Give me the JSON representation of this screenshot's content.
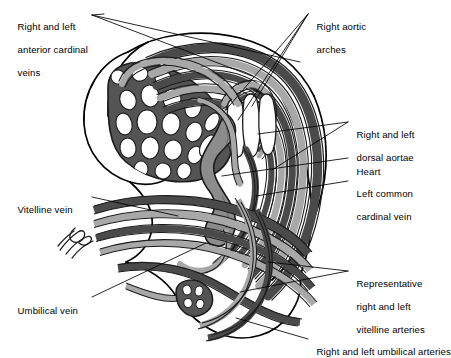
{
  "figure": {
    "background_color": "#ffffff",
    "width": 446,
    "height": 354
  },
  "palette": {
    "outline": "#000000",
    "vessel_dark": "#4a4a4a",
    "vessel_light": "#a8a8a8",
    "vessel_mid": "#6f6f6f",
    "heart_fill": "#8c8c8c",
    "plexus_fill": "#545454",
    "body_fill": "#ffffff",
    "leader_line": "#000000",
    "label_text": "#000000"
  },
  "labels": [
    {
      "id": "anterior-cardinal-veins",
      "lines": [
        "Right and left",
        "anterior cardinal",
        "veins"
      ],
      "text": "Right and left anterior cardinal veins",
      "align": "left",
      "x": 12,
      "y": 10
    },
    {
      "id": "right-aortic-arches",
      "lines": [
        "Right aortic",
        "arches"
      ],
      "text": "Right aortic arches",
      "align": "left",
      "x": 311,
      "y": 10
    },
    {
      "id": "dorsal-aortae",
      "lines": [
        "Right and left",
        "dorsal aortae"
      ],
      "text": "Right and left dorsal aortae",
      "align": "left",
      "x": 351,
      "y": 118
    },
    {
      "id": "heart",
      "lines": [
        "Heart"
      ],
      "text": "Heart",
      "align": "left",
      "x": 351,
      "y": 155
    },
    {
      "id": "left-common-cardinal-vein",
      "lines": [
        "Left common",
        "cardinal vein"
      ],
      "text": "Left common cardinal vein",
      "align": "left",
      "x": 351,
      "y": 177
    },
    {
      "id": "vitelline-vein",
      "lines": [
        "Vitelline vein"
      ],
      "text": "Vitelline vein",
      "align": "left",
      "x": 12,
      "y": 193
    },
    {
      "id": "vitelline-arteries",
      "lines": [
        "Representative",
        "right and left",
        "vitelline arteries"
      ],
      "text": "Representative right and left vitelline arteries",
      "align": "left",
      "x": 351,
      "y": 267
    },
    {
      "id": "umbilical-vein",
      "lines": [
        "Umbilical vein"
      ],
      "text": "Umbilical vein",
      "align": "left",
      "x": 12,
      "y": 294
    },
    {
      "id": "umbilical-arteries",
      "lines": [
        "Right and left umbilical arteries"
      ],
      "text": "Right and left umbilical arteries",
      "align": "left",
      "x": 311,
      "y": 335
    }
  ],
  "structures": [
    {
      "id": "embryo-outline",
      "name": "Embryo body outline"
    },
    {
      "id": "head-fold",
      "name": "Head fold / forebrain region"
    },
    {
      "id": "capillary-plexus",
      "name": "Cephalic capillary plexus"
    },
    {
      "id": "aortic-arches",
      "name": "Aortic arch series"
    },
    {
      "id": "dorsal-aorta-bands",
      "name": "Dorsal aortae bands"
    },
    {
      "id": "heart-tube",
      "name": "Heart tube"
    },
    {
      "id": "cardinal-veins",
      "name": "Anterior and common cardinal veins"
    },
    {
      "id": "vitelline-trunk",
      "name": "Vitelline vessels trunk"
    },
    {
      "id": "umbilical-trunk",
      "name": "Umbilical vessels trunk"
    },
    {
      "id": "umbilical-cord-stump",
      "name": "Umbilical cord cross-section"
    },
    {
      "id": "yolk-stalk-squiggle",
      "name": "Cut vessel stubs"
    }
  ]
}
